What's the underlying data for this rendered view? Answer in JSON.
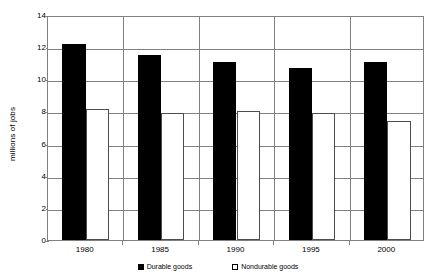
{
  "chart_data": {
    "type": "bar",
    "title": "",
    "subtitle": "",
    "xlabel": "",
    "ylabel": "millions of jobs",
    "categories": [
      "1980",
      "1985",
      "1990",
      "1995",
      "2000"
    ],
    "series": [
      {
        "name": "Durable goods",
        "color": "#000000",
        "fill": "solid-black",
        "values": [
          12.2,
          11.5,
          11.1,
          10.7,
          11.1
        ]
      },
      {
        "name": "Nondurable goods",
        "color": "#ffffff",
        "fill": "white-outlined",
        "values": [
          8.15,
          7.9,
          8.0,
          7.9,
          7.4
        ]
      }
    ],
    "ylim": [
      0,
      14
    ],
    "ytick_step": 2,
    "yticks": [
      "14",
      "12",
      "10",
      "8",
      "6",
      "4",
      "2",
      "0"
    ],
    "grid": "horizontal",
    "legend_position": "bottom-center",
    "plot_background": "#ffffff",
    "axis_color": "#808080",
    "text_color": "#000000"
  }
}
